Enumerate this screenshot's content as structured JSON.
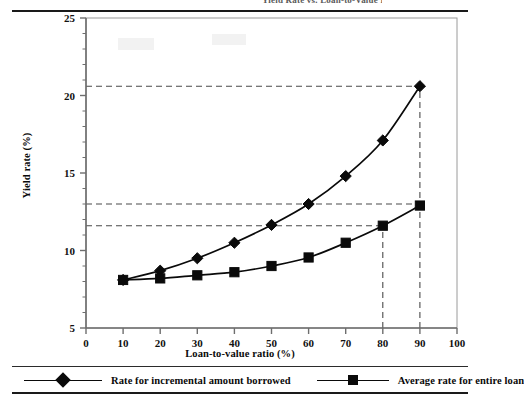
{
  "figure": {
    "title_clipped": "Yield Rate vs. Loan-to-Value Ratio"
  },
  "legend": {
    "position": "below-plot",
    "entries": [
      {
        "label": "Rate for incremental amount borrowed",
        "marker": "diamond-marker-icon",
        "color": "#0a0a0a"
      },
      {
        "label": "Average rate for entire loan",
        "marker": "square-marker-icon",
        "color": "#0a0a0a"
      }
    ]
  },
  "chart_data": {
    "type": "line",
    "title": "",
    "xlabel": "Loan-to-value ratio (%)",
    "ylabel": "Yield rate  (%)",
    "xlim": [
      0,
      100
    ],
    "ylim": [
      5,
      25
    ],
    "xticks": [
      0,
      10,
      20,
      30,
      40,
      50,
      60,
      70,
      80,
      90,
      100
    ],
    "xtick_labels": [
      "0",
      "10",
      "20",
      "30",
      "40",
      "50",
      "60",
      "70",
      "80",
      "90",
      "100"
    ],
    "yticks": [
      5,
      10,
      15,
      20,
      25
    ],
    "ytick_labels": [
      "5",
      "10",
      "15",
      "20",
      "25"
    ],
    "yminor_ticks": [
      6,
      7,
      8,
      9,
      11,
      12,
      13,
      14,
      16,
      17,
      18,
      19,
      21,
      22,
      23,
      24
    ],
    "grid": false,
    "x": [
      10,
      20,
      30,
      40,
      50,
      60,
      70,
      80,
      90
    ],
    "series": [
      {
        "name": "Rate for incremental amount borrowed",
        "marker": "diamond",
        "color": "#0a0a0a",
        "values": [
          8.1,
          8.7,
          9.5,
          10.5,
          11.65,
          13.0,
          14.8,
          17.1,
          20.6
        ]
      },
      {
        "name": "Average rate for entire loan",
        "marker": "square",
        "color": "#0a0a0a",
        "values": [
          8.1,
          8.2,
          8.4,
          8.6,
          9.0,
          9.55,
          10.5,
          11.6,
          12.9
        ]
      }
    ],
    "annotations": {
      "hlines": [
        {
          "y": 20.6,
          "from_x": 0,
          "to_x": 90,
          "style": "dashed"
        },
        {
          "y": 13.0,
          "from_x": 0,
          "to_x": 90,
          "style": "dashed"
        },
        {
          "y": 11.6,
          "from_x": 0,
          "to_x": 80,
          "style": "dashed"
        }
      ],
      "vlines": [
        {
          "x": 80,
          "from_y": 5,
          "to_y": 11.6,
          "style": "dashed"
        },
        {
          "x": 90,
          "from_y": 5,
          "to_y": 20.6,
          "style": "dashed"
        }
      ]
    }
  }
}
